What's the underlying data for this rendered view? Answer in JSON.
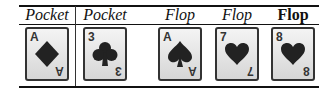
{
  "columns": [
    {
      "header": "Pocket",
      "style": "italic",
      "card": {
        "rank": "A",
        "suit": "diamond"
      }
    },
    {
      "header": "Pocket",
      "style": "italic",
      "card": {
        "rank": "3",
        "suit": "club"
      }
    },
    {
      "header": "Flop",
      "style": "italic",
      "card": {
        "rank": "A",
        "suit": "spade"
      }
    },
    {
      "header": "Flop",
      "style": "italic",
      "card": {
        "rank": "7",
        "suit": "heart"
      }
    },
    {
      "header": "Flop",
      "style": "bold",
      "card": {
        "rank": "8",
        "suit": "heart"
      }
    }
  ],
  "colors": {
    "suit": "#222222",
    "border": "#333333"
  }
}
